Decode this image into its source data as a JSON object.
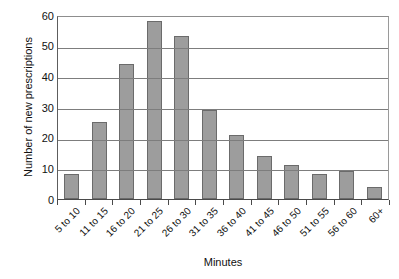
{
  "chart_data": {
    "type": "bar",
    "title": "",
    "xlabel": "Minutes",
    "ylabel": "Number of new prescriptions",
    "categories": [
      "5 to 10",
      "11 to 15",
      "16 to 20",
      "21 to 25",
      "26 to 30",
      "31 to 35",
      "36 to 40",
      "41 to 45",
      "46 to 50",
      "51 to 55",
      "56 to 60",
      "60+"
    ],
    "values": [
      8,
      25,
      44,
      58,
      53,
      29,
      21,
      14,
      11,
      8,
      9,
      4
    ],
    "ylim": [
      0,
      60
    ],
    "ytick_labels": [
      "0",
      "10",
      "20",
      "30",
      "40",
      "50",
      "60"
    ],
    "ytick_values": [
      0,
      10,
      20,
      30,
      40,
      50,
      60
    ],
    "grid": true,
    "grid_axis": "y",
    "legend": false,
    "bar_color": "#9d9d9d",
    "bar_edge_color": "#6b6b6b",
    "gridline_color": "#7d7d7d",
    "axis_color": "#4a4a4a"
  }
}
